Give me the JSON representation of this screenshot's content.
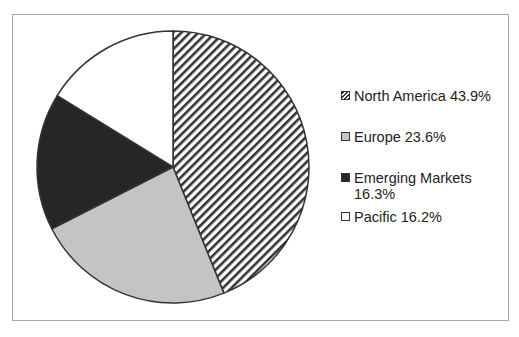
{
  "chart_data": {
    "type": "pie",
    "title": "",
    "slices": [
      {
        "label": "North America",
        "value": 43.9,
        "display": "North America 43.9%",
        "fill": "hatch",
        "color": "#333333"
      },
      {
        "label": "Europe",
        "value": 23.6,
        "display": "Europe 23.6%",
        "fill": "solid",
        "color": "#c4c4c4"
      },
      {
        "label": "Emerging Markets",
        "value": 16.3,
        "display": "Emerging Markets 16.3%",
        "fill": "solid",
        "color": "#262626"
      },
      {
        "label": "Pacific",
        "value": 16.2,
        "display": "Pacific 16.2%",
        "fill": "solid",
        "color": "#ffffff"
      }
    ],
    "start_angle": "12 o'clock, clockwise",
    "legend_position": "right"
  },
  "legend": {
    "items": [
      {
        "line1": "North America 43.9%",
        "line2": ""
      },
      {
        "line1": "Europe 23.6%",
        "line2": ""
      },
      {
        "line1": "Emerging Markets",
        "line2": "16.3%"
      },
      {
        "line1": "Pacific 16.2%",
        "line2": ""
      }
    ]
  }
}
